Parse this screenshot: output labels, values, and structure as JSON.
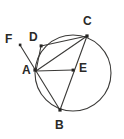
{
  "figure": {
    "kind": "circle-geometry-diagram",
    "background_color": "#ffffff",
    "stroke_color": "#3b3a38",
    "label_color": "#2a2927",
    "circle": {
      "center_x": 73,
      "center_y": 73,
      "radius": 38
    },
    "points": [
      {
        "id": "A",
        "label": "A",
        "x": 36,
        "y": 71,
        "label_x": 22,
        "label_y": 64,
        "on_circle": true,
        "has_dot": true
      },
      {
        "id": "B",
        "label": "B",
        "x": 60,
        "y": 110,
        "label_x": 55,
        "label_y": 119,
        "on_circle": true,
        "has_dot": true
      },
      {
        "id": "C",
        "label": "C",
        "x": 87,
        "y": 36,
        "label_x": 83,
        "label_y": 15,
        "on_circle": true,
        "has_dot": true
      },
      {
        "id": "D",
        "label": "D",
        "x": 41,
        "y": 46,
        "label_x": 29,
        "label_y": 31,
        "on_circle": true,
        "has_dot": true
      },
      {
        "id": "E",
        "label": "E",
        "x": 73,
        "y": 70,
        "label_x": 79,
        "label_y": 62,
        "on_circle": false,
        "has_dot": true
      },
      {
        "id": "F",
        "label": "F",
        "x": 20,
        "y": 45,
        "label_x": 5,
        "label_y": 33,
        "on_circle": false,
        "has_dot": true
      }
    ],
    "segments": [
      {
        "id": "AD",
        "from": "A",
        "to": "D",
        "kind": "chord"
      },
      {
        "id": "AC",
        "from": "A",
        "to": "C",
        "kind": "chord"
      },
      {
        "id": "AB",
        "from": "A",
        "to": "B",
        "kind": "chord"
      },
      {
        "id": "DC",
        "from": "D",
        "to": "C",
        "kind": "chord"
      },
      {
        "id": "CB",
        "from": "C",
        "to": "B",
        "kind": "chord"
      },
      {
        "id": "AE",
        "from": "A",
        "to": "E",
        "kind": "chord"
      },
      {
        "id": "FA",
        "from": "F",
        "to": "A",
        "kind": "ray"
      }
    ]
  }
}
